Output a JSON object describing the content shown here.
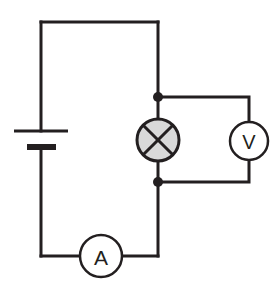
{
  "diagram": {
    "background_color": "#ffffff",
    "line_color": "#231f20",
    "lamp_fill_color": "#d9d9d9",
    "meter_fill_color": "#ffffff"
  },
  "components": {
    "battery": {
      "name": "cell",
      "symbol": "two-plate-cell",
      "long_plate": {
        "x1": 14,
        "x2": 68,
        "y": 131,
        "thickness": 3
      },
      "short_plate": {
        "x1": 27,
        "x2": 56,
        "y": 147,
        "thickness": 6
      },
      "terminal_x": 41
    },
    "lamp": {
      "name": "lamp",
      "symbol": "crossed-circle",
      "cx": 158,
      "cy": 140,
      "r": 21,
      "fill": "#d9d9d9"
    },
    "voltmeter": {
      "name": "voltmeter",
      "symbol": "circle-with-letter",
      "label": "V",
      "cx": 249,
      "cy": 141,
      "r": 19,
      "font_size": 20
    },
    "ammeter": {
      "name": "ammeter",
      "symbol": "circle-with-letter",
      "label": "A",
      "cx": 101,
      "cy": 256,
      "r": 21,
      "font_size": 21
    }
  },
  "junctions": [
    {
      "name": "top-junction",
      "cx": 158,
      "cy": 97,
      "r": 5
    },
    {
      "name": "bottom-junction",
      "cx": 158,
      "cy": 182,
      "r": 5
    }
  ],
  "wires": {
    "main_loop": {
      "left_x": 41,
      "right_x": 158,
      "top_y": 22,
      "bottom_y": 256,
      "stroke_width": 3
    },
    "voltmeter_branch": {
      "branch_x": 249,
      "top_y": 97,
      "bottom_y": 182,
      "stroke_width": 3
    }
  },
  "paths": {
    "top_wire": "M 41 22 L 158 22",
    "left_wire_upper": "M 41 22 L 41 131",
    "left_wire_lower": "M 41 147 L 41 256",
    "bottom_wire_left": "M 41 256 L 80 256",
    "bottom_wire_right": "M 122 256 L 158 256",
    "right_wire_upper": "M 158 22 L 158 119",
    "right_wire_middle": "M 158 161 L 158 256",
    "voltmeter_top_lead": "M 158 97 L 249 97 L 249 122",
    "voltmeter_bottom_lead": "M 249 160 L 249 182 L 158 182",
    "lamp_cross_a": "M 143.2 125.2 L 172.8 154.8",
    "lamp_cross_b": "M 172.8 125.2 L 143.2 154.8"
  }
}
